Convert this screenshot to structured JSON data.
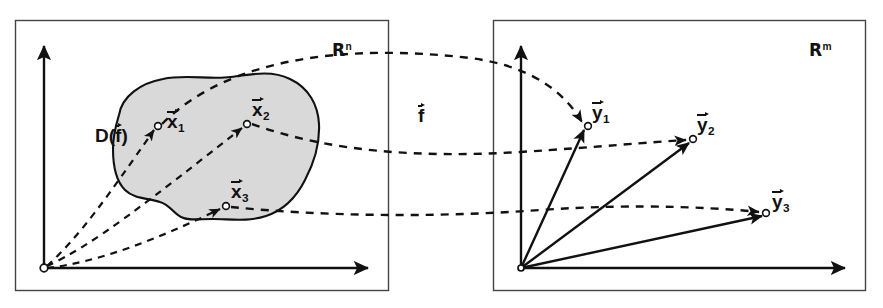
{
  "figure": {
    "background_color": "#ffffff",
    "ink_color": "#111111",
    "blob_fill_color": "#d9d9d9"
  },
  "panels": {
    "left": {
      "name": "domain-panel",
      "space_label": "R",
      "space_exponent": "n",
      "domain_label": "D(",
      "domain_label_close": ")",
      "domain_label_symbol": "f",
      "axis_vertical": "vertical-axis",
      "axis_horizontal": "horizontal-axis",
      "origin_label": "origin",
      "points": [
        {
          "symbol": "x",
          "index": "1"
        },
        {
          "symbol": "x",
          "index": "2"
        },
        {
          "symbol": "x",
          "index": "3"
        }
      ]
    },
    "right": {
      "name": "codomain-panel",
      "space_label": "R",
      "space_exponent": "m",
      "axis_vertical": "vertical-axis",
      "axis_horizontal": "horizontal-axis",
      "origin_label": "origin",
      "points": [
        {
          "symbol": "y",
          "index": "1"
        },
        {
          "symbol": "y",
          "index": "2"
        },
        {
          "symbol": "y",
          "index": "3"
        }
      ]
    }
  },
  "mapping": {
    "function_symbol": "f",
    "arrow_style": "dashed",
    "count": 3
  }
}
